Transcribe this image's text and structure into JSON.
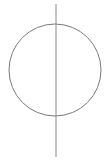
{
  "canvas": {
    "width": 109,
    "height": 162,
    "background_color": "#ffffff",
    "description": "Line drawing: an unfilled circle bisected by a vertical line that extends beyond the circle at top and bottom"
  },
  "figure": {
    "name": "circle-with-vertical-axis",
    "stroke_color": "#7b7b7b",
    "stroke_width": 1,
    "fill": "none",
    "shapes": [
      {
        "id": "circle",
        "type": "circle",
        "label": "circle-outline",
        "cx": 55,
        "cy": 70,
        "r": 46,
        "stroke_color": "#7b7b7b",
        "stroke_width": 1,
        "fill": "none",
        "bounds": {
          "left": 9,
          "top": 24,
          "right": 101,
          "bottom": 116
        }
      },
      {
        "id": "axis",
        "type": "line",
        "label": "vertical-axis-line",
        "x1": 56,
        "y1": 4,
        "x2": 56,
        "y2": 157,
        "stroke_color": "#8a8a8a",
        "stroke_width": 1
      }
    ]
  }
}
